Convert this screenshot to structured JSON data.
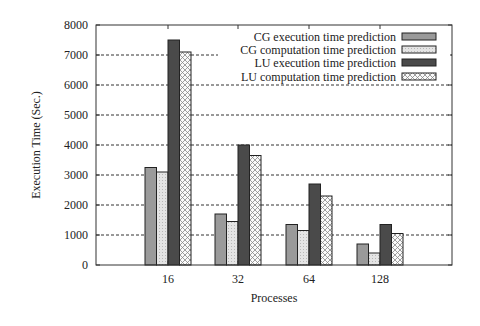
{
  "chart_data": {
    "type": "bar",
    "title": "",
    "xlabel": "Processes",
    "ylabel": "Execution Time (Sec.)",
    "ylim": [
      0,
      8000
    ],
    "yticks": [
      0,
      1000,
      2000,
      3000,
      4000,
      5000,
      6000,
      7000,
      8000
    ],
    "grid": "horizontal dashed",
    "legend_position": "top-right inside",
    "categories": [
      "16",
      "32",
      "64",
      "128"
    ],
    "series": [
      {
        "name": "CG execution time prediction",
        "style": "light-gray",
        "values": [
          3250,
          1700,
          1350,
          700
        ]
      },
      {
        "name": "CG computation time prediction",
        "style": "lighter-gray-dotted",
        "values": [
          3100,
          1450,
          1150,
          400
        ]
      },
      {
        "name": "LU execution time prediction",
        "style": "dark-gray",
        "values": [
          7500,
          4000,
          2700,
          1350
        ]
      },
      {
        "name": "LU computation time prediction",
        "style": "white-crosshatch",
        "values": [
          7100,
          3650,
          2300,
          1050
        ]
      }
    ]
  },
  "colors": {
    "cg_exec": "#9a9a9a",
    "cg_comp": "#d8d8d8",
    "lu_exec": "#4a4a4a",
    "lu_comp": "#f0f0f0",
    "axis": "#333333",
    "grid": "#333333"
  }
}
